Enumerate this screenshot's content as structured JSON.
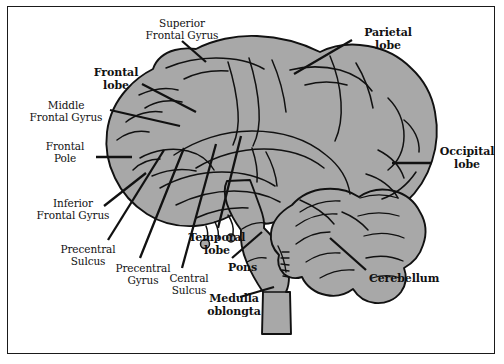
{
  "figure": {
    "type": "anatomical-diagram",
    "colors": {
      "brain_fill": "#a8a8a8",
      "outline": "#111111",
      "leader_line": "#111111",
      "background": "#ffffff",
      "frame_border": "#1a1a1a",
      "text": "#111111"
    }
  },
  "labels": [
    {
      "id": "superior-frontal-gyrus",
      "text": "Superior\nFrontal Gyrus",
      "bold": false,
      "align": "center",
      "x": 134,
      "y": 17,
      "width": 96
    },
    {
      "id": "frontal-lobe",
      "text": "Frontal\nlobe",
      "bold": true,
      "align": "center",
      "x": 84,
      "y": 66,
      "width": 64
    },
    {
      "id": "middle-frontal-gyrus",
      "text": "Middle\nFrontal Gyrus",
      "bold": false,
      "align": "center",
      "x": 20,
      "y": 99,
      "width": 92
    },
    {
      "id": "frontal-pole",
      "text": "Frontal\nPole",
      "bold": false,
      "align": "center",
      "x": 32,
      "y": 140,
      "width": 66
    },
    {
      "id": "inferior-frontal-gyrus",
      "text": "Inferior\nFrontal Gyrus",
      "bold": false,
      "align": "center",
      "x": 27,
      "y": 197,
      "width": 92
    },
    {
      "id": "precentral-sulcus",
      "text": "Precentral\nSulcus",
      "bold": false,
      "align": "center",
      "x": 51,
      "y": 243,
      "width": 74
    },
    {
      "id": "precentral-gyrus",
      "text": "Precentral\nGyrus",
      "bold": false,
      "align": "center",
      "x": 106,
      "y": 262,
      "width": 74
    },
    {
      "id": "central-sulcus",
      "text": "Central\nSulcus",
      "bold": false,
      "align": "center",
      "x": 158,
      "y": 272,
      "width": 62
    },
    {
      "id": "temporal-lobe",
      "text": "Temporal\nlobe",
      "bold": true,
      "align": "center",
      "x": 180,
      "y": 231,
      "width": 74
    },
    {
      "id": "pons",
      "text": "Pons",
      "bold": true,
      "align": "left",
      "x": 228,
      "y": 261,
      "width": 40
    },
    {
      "id": "medulla-oblongta",
      "text": "Medulla\noblongta",
      "bold": true,
      "align": "center",
      "x": 197,
      "y": 292,
      "width": 74
    },
    {
      "id": "parietal-lobe",
      "text": "Parietal\nlobe",
      "bold": true,
      "align": "center",
      "x": 355,
      "y": 26,
      "width": 66
    },
    {
      "id": "occipital-lobe",
      "text": "Occipital\nlobe",
      "bold": true,
      "align": "center",
      "x": 434,
      "y": 145,
      "width": 66
    },
    {
      "id": "cerebellum",
      "text": "Cerebellum",
      "bold": true,
      "align": "left",
      "x": 369,
      "y": 272,
      "width": 86
    }
  ]
}
